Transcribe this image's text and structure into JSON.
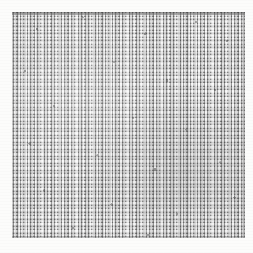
{
  "page": {
    "background_color": "#fcfcfb",
    "width": 253,
    "height": 253,
    "kind": "scanned-plate"
  },
  "ghost_text": {
    "left_fragment": "",
    "right_fragment": "",
    "color": "#e9e9e6",
    "note": ""
  },
  "plate": {
    "caption": "",
    "x": 12,
    "y": 12,
    "width": 233,
    "height": 226,
    "fill_color": "#b9b9b9",
    "seam_color": "#6a6a6a",
    "cell_light_color": "#ffffff",
    "cell_mid_color": "#a9a9a9",
    "speck_color": "#464646",
    "pattern": "woven-brick-grid"
  }
}
